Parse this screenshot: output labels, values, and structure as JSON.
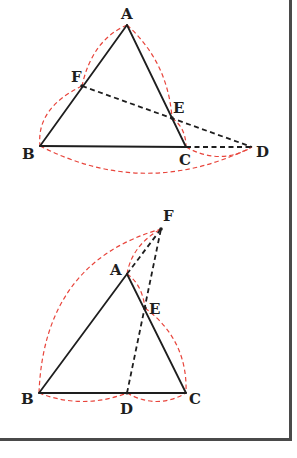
{
  "figures": [
    {
      "id": "top",
      "description": "Triangle ABC with line through F on AB and E on AC meeting extension of BC at D",
      "points": {
        "A": {
          "x": 127,
          "y": 25,
          "label": "A",
          "lx": 121,
          "ly": 19
        },
        "B": {
          "x": 40,
          "y": 146,
          "label": "B",
          "lx": 22,
          "ly": 159
        },
        "C": {
          "x": 186,
          "y": 147,
          "label": "C",
          "lx": 179,
          "ly": 165
        },
        "D": {
          "x": 252,
          "y": 147,
          "label": "D",
          "lx": 256,
          "ly": 157
        },
        "E": {
          "x": 172,
          "y": 118,
          "label": "E",
          "lx": 173,
          "ly": 113
        },
        "F": {
          "x": 82,
          "y": 86,
          "label": "F",
          "lx": 71,
          "ly": 82
        }
      }
    },
    {
      "id": "bottom",
      "description": "Triangle ABC with D on BC, line DE extended through E on AC meets extension of BA at F",
      "points": {
        "A": {
          "x": 127,
          "y": 274,
          "label": "A",
          "lx": 110,
          "ly": 275
        },
        "B": {
          "x": 39,
          "y": 393,
          "label": "B",
          "lx": 21,
          "ly": 404
        },
        "C": {
          "x": 186,
          "y": 393,
          "label": "C",
          "lx": 189,
          "ly": 404
        },
        "D": {
          "x": 127,
          "y": 393,
          "label": "D",
          "lx": 120,
          "ly": 414
        },
        "E": {
          "x": 145,
          "y": 308,
          "label": "E",
          "lx": 149,
          "ly": 314
        },
        "F": {
          "x": 161,
          "y": 229,
          "label": "F",
          "lx": 163,
          "ly": 221
        }
      }
    }
  ],
  "colors": {
    "line": "#1e1e1e",
    "arc": "#e8453c",
    "border": "#4a4a4a"
  }
}
